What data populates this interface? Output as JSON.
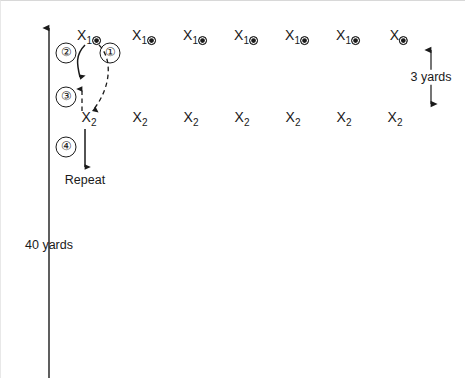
{
  "diagram": {
    "background_color": "#ffffff",
    "ink_color": "#1a1a1a",
    "width": 465,
    "height": 378,
    "rows": [
      {
        "row_id": "top-row",
        "label_base": "X",
        "label_sub": "1",
        "has_ball": true,
        "y": 36,
        "markers": [
          {
            "label_base": "X",
            "label_sub": "1",
            "has_ball": true,
            "x": 88
          },
          {
            "label_base": "X",
            "label_sub": "1",
            "has_ball": true,
            "x": 143
          },
          {
            "label_base": "X",
            "label_sub": "1",
            "has_ball": true,
            "x": 194
          },
          {
            "label_base": "X",
            "label_sub": "1",
            "has_ball": true,
            "x": 245
          },
          {
            "label_base": "X",
            "label_sub": "1",
            "has_ball": true,
            "x": 296
          },
          {
            "label_base": "X",
            "label_sub": "1",
            "has_ball": true,
            "x": 347
          },
          {
            "label_base": "X",
            "label_sub": "",
            "has_ball": true,
            "x": 398
          }
        ]
      },
      {
        "row_id": "bottom-row",
        "label_base": "X",
        "label_sub": "2",
        "has_ball": false,
        "y": 118,
        "markers": [
          {
            "label_base": "X",
            "label_sub": "2",
            "has_ball": false,
            "x": 88
          },
          {
            "label_base": "X",
            "label_sub": "2",
            "has_ball": false,
            "x": 139
          },
          {
            "label_base": "X",
            "label_sub": "2",
            "has_ball": false,
            "x": 190
          },
          {
            "label_base": "X",
            "label_sub": "2",
            "has_ball": false,
            "x": 241
          },
          {
            "label_base": "X",
            "label_sub": "2",
            "has_ball": false,
            "x": 292
          },
          {
            "label_base": "X",
            "label_sub": "2",
            "has_ball": false,
            "x": 343
          },
          {
            "label_base": "X",
            "label_sub": "2",
            "has_ball": false,
            "x": 394
          }
        ]
      }
    ],
    "steps": [
      {
        "id": "step-1",
        "number": "①",
        "x": 109,
        "y": 52,
        "path_style": "dashed",
        "description": "dashed curve from X1 down to X2"
      },
      {
        "id": "step-2",
        "number": "②",
        "x": 65,
        "y": 52,
        "path_style": "solid",
        "description": "solid curve from X1 down toward midpoint"
      },
      {
        "id": "step-3",
        "number": "③",
        "x": 65,
        "y": 96,
        "path_style": "dashed",
        "description": "dashed arrow pointing up from X2"
      },
      {
        "id": "step-4",
        "number": "④",
        "x": 65,
        "y": 146,
        "path_style": "solid",
        "description": "solid arrow down to Repeat"
      }
    ],
    "labels": {
      "repeat": "Repeat",
      "distance_vertical": "40 yards",
      "distance_spacing": "3 yards"
    },
    "label_positions": {
      "repeat": {
        "x": 84,
        "y": 173
      },
      "distance_vertical": {
        "x": 48,
        "y": 238
      },
      "distance_spacing": {
        "x": 430,
        "y": 76
      }
    },
    "axis": {
      "name": "vertical-distance-axis",
      "x": 48,
      "y_top": 26,
      "y_bottom": 378,
      "arrow_at_top": true
    },
    "spacing_arrow": {
      "name": "spacing-measure-arrow",
      "x": 430,
      "y_top": 48,
      "y_bottom": 104,
      "double_headed": true
    }
  }
}
